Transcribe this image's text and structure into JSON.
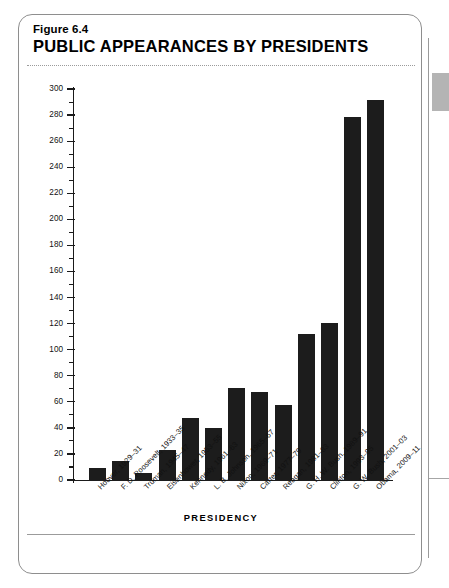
{
  "figure": {
    "number": "Figure 6.4",
    "title": "PUBLIC APPEARANCES BY PRESIDENTS"
  },
  "chart_data": {
    "type": "bar",
    "title": "PUBLIC APPEARANCES BY PRESIDENTS",
    "subtitle": "Figure 6.4",
    "xlabel": "PRESIDENCY",
    "ylabel": "APPEARANCES",
    "ylim": [
      0,
      300
    ],
    "ytick_step": 20,
    "yminor_step": 10,
    "grid": false,
    "legend": null,
    "bar_color": "#1c1c1c",
    "categories": [
      "Hoover, 1929–31",
      "F. D. Roosevelt, 1933–35",
      "Truman, 1945–47",
      "Eisenhower, 1953–55",
      "Kennedy, 1961–63",
      "L. B. Johnson, 1965–67",
      "Nixon, 1969–71",
      "Carter, 1977–79",
      "Reagan, 1981–83",
      "G. H. W. Bush, 1989–91",
      "Clinton, 1993–95",
      "G. W. Bush, 2001–03",
      "Obama, 2009–11"
    ],
    "values": [
      10,
      15,
      6,
      24,
      48,
      41,
      71,
      68,
      58,
      113,
      121,
      279,
      292
    ],
    "yticks": [
      0,
      20,
      40,
      60,
      80,
      100,
      120,
      140,
      160,
      180,
      200,
      220,
      240,
      260,
      280,
      300
    ],
    "ytick_labels": [
      "0",
      "20",
      "40",
      "60",
      "80",
      "100",
      "120",
      "140",
      "160",
      "180",
      "200",
      "220",
      "240",
      "260",
      "280",
      "300"
    ]
  }
}
